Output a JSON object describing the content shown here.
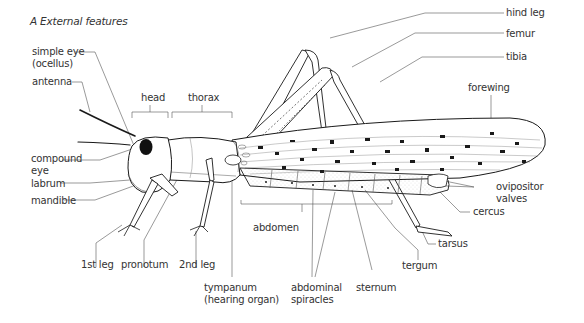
{
  "figure": {
    "title": "A  External features",
    "labels": {
      "simple_eye": "simple eye",
      "simple_eye_sub": "(ocellus)",
      "antenna": "antenna",
      "head": "head",
      "thorax": "thorax",
      "compound_eye": "compound",
      "compound_eye_sub": "eye",
      "labrum": "labrum",
      "mandible": "mandible",
      "first_leg": "1st leg",
      "pronotum": "pronotum",
      "second_leg": "2nd leg",
      "tympanum": "tympanum",
      "tympanum_sub": "(hearing organ)",
      "abdomen": "abdomen",
      "abdominal_spiracles": "abdominal",
      "abdominal_spiracles_sub": "spiracles",
      "sternum": "sternum",
      "tergum": "tergum",
      "tarsus": "tarsus",
      "cercus": "cercus",
      "ovipositor_valves": "ovipositor",
      "ovipositor_valves_sub": "valves",
      "hind_leg": "hind leg",
      "femur": "femur",
      "tibia": "tibia",
      "forewing": "forewing"
    },
    "colors": {
      "ink": "#1a1a1a",
      "leader": "#555555",
      "text": "#333333",
      "background": "#ffffff"
    }
  }
}
